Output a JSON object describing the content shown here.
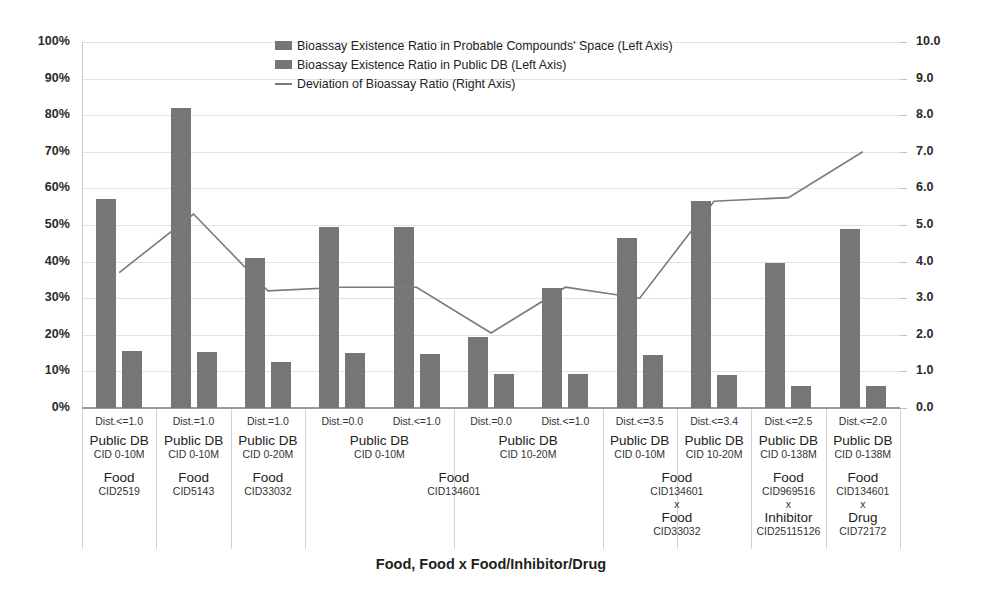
{
  "chart_data": {
    "type": "bar",
    "title": "",
    "xlabel": "Food, Food x Food/Inhibitor/Drug",
    "ylabel": "",
    "ylim": [
      0,
      100
    ],
    "y2lim": [
      0,
      10
    ],
    "grid": true,
    "legend_position": "top-center",
    "y_ticks": [
      "0%",
      "10%",
      "20%",
      "30%",
      "40%",
      "50%",
      "60%",
      "70%",
      "80%",
      "90%",
      "100%"
    ],
    "y2_ticks": [
      "0.0",
      "1.0",
      "2.0",
      "3.0",
      "4.0",
      "5.0",
      "6.0",
      "7.0",
      "8.0",
      "9.0",
      "10.0"
    ],
    "legend": [
      "Bioassay Existence Ratio in Probable Compounds' Space (Left Axis)",
      "Bioassay Existence Ratio in Public DB (Left Axis)",
      "Deviation of Bioassay Ratio (Right Axis)"
    ],
    "categories": [
      "Dist.<=1.0",
      "Dist.=1.0",
      "Dist.=1.0",
      "Dist.=0.0",
      "Dist.<=1.0",
      "Dist.=0.0",
      "Dist.<=1.0",
      "Dist.<=3.5",
      "Dist.<=3.4",
      "Dist.<=2.5",
      "Dist.<=2.0"
    ],
    "series": [
      {
        "name": "Bioassay Existence Ratio in Probable Compounds' Space (Left Axis)",
        "axis": "left",
        "values": [
          57.0,
          82.0,
          41.0,
          49.5,
          49.5,
          19.5,
          32.8,
          46.5,
          56.5,
          39.7,
          49.0
        ]
      },
      {
        "name": "Bioassay Existence Ratio in Public DB (Left Axis)",
        "axis": "left",
        "values": [
          15.5,
          15.3,
          12.7,
          15.0,
          14.8,
          9.3,
          9.2,
          14.5,
          9.0,
          6.0,
          6.0
        ]
      },
      {
        "name": "Deviation of Bioassay Ratio (Right Axis)",
        "axis": "right",
        "type": "line",
        "values": [
          3.7,
          5.3,
          3.2,
          3.3,
          3.3,
          2.05,
          3.3,
          3.0,
          5.65,
          5.75,
          7.0
        ]
      }
    ],
    "group_labels": [
      {
        "span": [
          0,
          0
        ],
        "line1": "Public DB",
        "line2": "CID 0-10M"
      },
      {
        "span": [
          1,
          1
        ],
        "line1": "Public DB",
        "line2": "CID 0-10M"
      },
      {
        "span": [
          2,
          2
        ],
        "line1": "Public DB",
        "line2": "CID 0-20M"
      },
      {
        "span": [
          3,
          4
        ],
        "line1": "Public DB",
        "line2": "CID 0-10M"
      },
      {
        "span": [
          5,
          6
        ],
        "line1": "Public DB",
        "line2": "CID 10-20M"
      },
      {
        "span": [
          7,
          7
        ],
        "line1": "Public DB",
        "line2": "CID 0-10M"
      },
      {
        "span": [
          8,
          8
        ],
        "line1": "Public DB",
        "line2": "CID 10-20M"
      },
      {
        "span": [
          9,
          9
        ],
        "line1": "Public DB",
        "line2": "CID 0-138M"
      },
      {
        "span": [
          10,
          10
        ],
        "line1": "Public DB",
        "line2": "CID 0-138M"
      }
    ],
    "sub_labels": [
      {
        "span": [
          0,
          0
        ],
        "parts": [
          {
            "name": "Food",
            "cid": "CID2519"
          }
        ]
      },
      {
        "span": [
          1,
          1
        ],
        "parts": [
          {
            "name": "Food",
            "cid": "CID5143"
          }
        ]
      },
      {
        "span": [
          2,
          2
        ],
        "parts": [
          {
            "name": "Food",
            "cid": "CID33032"
          }
        ]
      },
      {
        "span": [
          3,
          6
        ],
        "parts": [
          {
            "name": "Food",
            "cid": "CID134601"
          }
        ]
      },
      {
        "span": [
          7,
          8
        ],
        "parts": [
          {
            "name": "Food",
            "cid": "CID134601"
          },
          {
            "name": "Food",
            "cid": "CID33032"
          }
        ],
        "sep": "x"
      },
      {
        "span": [
          9,
          9
        ],
        "parts": [
          {
            "name": "Food",
            "cid": "CID969516"
          },
          {
            "name": "Inhibitor",
            "cid": "CID25115126"
          }
        ],
        "sep": "x"
      },
      {
        "span": [
          10,
          10
        ],
        "parts": [
          {
            "name": "Food",
            "cid": "CID134601"
          },
          {
            "name": "Drug",
            "cid": "CID72172"
          }
        ],
        "sep": "x"
      }
    ],
    "colors": {
      "bar_probable": "#767676",
      "bar_publicdb": "#767676",
      "line_deviation": "#7a7a7a",
      "gridline": "#e2e2e2",
      "axis": "#9a9a9a"
    }
  }
}
